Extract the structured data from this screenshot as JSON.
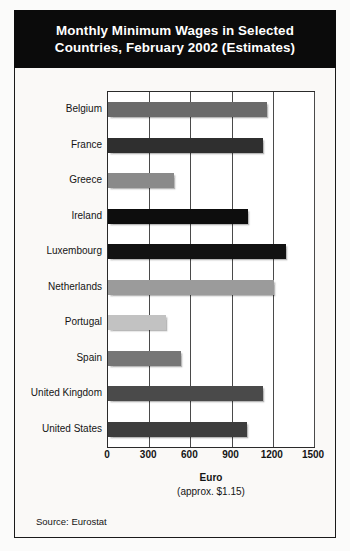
{
  "title": {
    "line1": "Monthly Minimum Wages in Selected",
    "line2": "Countries, February 2002 (Estimates)"
  },
  "footer": {
    "source": "Source: Eurostat"
  },
  "chart_data": {
    "type": "bar",
    "orientation": "horizontal",
    "title": "Monthly Minimum Wages in Selected Countries, February 2002 (Estimates)",
    "xlabel": "Euro",
    "xlabel_note": "(approx. $1.15)",
    "ylabel": "",
    "xlim": [
      0,
      1500
    ],
    "xticks": [
      0,
      300,
      600,
      900,
      1200,
      1500
    ],
    "xtick_labels": [
      "0",
      "300",
      "600",
      "900",
      "1200",
      "1500"
    ],
    "grid": true,
    "legend": false,
    "source": "Source: Eurostat",
    "categories": [
      "Belgium",
      "France",
      "Greece",
      "Ireland",
      "Luxembourg",
      "Netherlands",
      "Portugal",
      "Spain",
      "United Kingdom",
      "United States"
    ],
    "values": [
      1157,
      1126,
      483,
      1018,
      1297,
      1207,
      423,
      531,
      1128,
      1015
    ],
    "bar_colors": [
      "#6a6a6a",
      "#2f2f2f",
      "#8a8a8a",
      "#0d0d0d",
      "#121212",
      "#9b9b9b",
      "#c2c2c2",
      "#767676",
      "#4a4a4a",
      "#3d3d3d"
    ],
    "bars": [
      {
        "category": "Belgium",
        "value": 1157,
        "color": "#6a6a6a"
      },
      {
        "category": "France",
        "value": 1126,
        "color": "#2f2f2f"
      },
      {
        "category": "Greece",
        "value": 483,
        "color": "#8a8a8a"
      },
      {
        "category": "Ireland",
        "value": 1018,
        "color": "#0d0d0d"
      },
      {
        "category": "Luxembourg",
        "value": 1297,
        "color": "#121212"
      },
      {
        "category": "Netherlands",
        "value": 1207,
        "color": "#9b9b9b"
      },
      {
        "category": "Portugal",
        "value": 423,
        "color": "#c2c2c2"
      },
      {
        "category": "Spain",
        "value": 531,
        "color": "#767676"
      },
      {
        "category": "United Kingdom",
        "value": 1128,
        "color": "#4a4a4a"
      },
      {
        "category": "United States",
        "value": 1015,
        "color": "#3d3d3d"
      }
    ]
  }
}
